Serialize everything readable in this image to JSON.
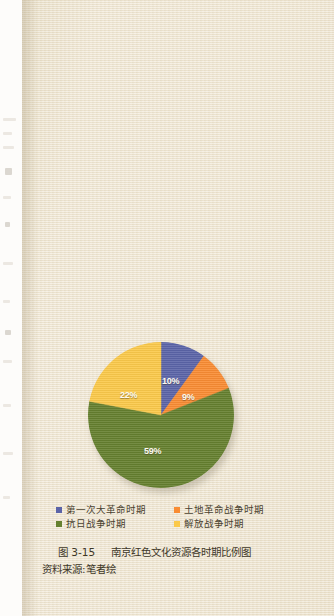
{
  "page": {
    "background_color": "#efe6d2",
    "gutter_color": "#fdfcfa"
  },
  "chart_data": {
    "type": "pie",
    "title": "南京红色文化资源各时期比例图",
    "xlabel": "",
    "ylabel": "",
    "legend_position": "bottom",
    "grid": false,
    "categories": [
      "第一次大革命时期",
      "土地革命战争时期",
      "抗日战争时期",
      "解放战争时期"
    ],
    "values": [
      10,
      9,
      59,
      22
    ],
    "value_labels": [
      "10%",
      "9%",
      "59%",
      "22%"
    ],
    "colors": [
      "#5b64a8",
      "#f98c33",
      "#65802f",
      "#fbc94a"
    ],
    "start_angle_deg": 0,
    "direction": "clockwise"
  },
  "legend": {
    "items": [
      {
        "label": "第一次大革命时期",
        "color": "#5b64a8"
      },
      {
        "label": "土地革命战争时期",
        "color": "#f98c33"
      },
      {
        "label": "抗日战争时期",
        "color": "#65802f"
      },
      {
        "label": "解放战争时期",
        "color": "#fbc94a"
      }
    ]
  },
  "caption": {
    "figure_number": "图 3-15",
    "figure_title": "南京红色文化资源各时期比例图",
    "source": "资料来源:笔者绘"
  },
  "slice_labels": {
    "s0": "10%",
    "s1": "9%",
    "s2": "59%",
    "s3": "22%"
  }
}
